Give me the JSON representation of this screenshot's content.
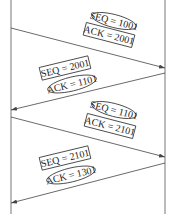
{
  "diagram": {
    "type": "sequence",
    "participants": [
      "left-host",
      "right-host"
    ],
    "colors": {
      "line": "#555555",
      "text": "#222222",
      "background": "#ffffff"
    },
    "messages": [
      {
        "direction": "left-to-right",
        "seq_label": "SEQ = 1001",
        "seq_shape": "ellipse",
        "ack_label": "ACK = 2001",
        "ack_shape": "box"
      },
      {
        "direction": "right-to-left",
        "seq_label": "SEQ = 2001",
        "seq_shape": "box",
        "ack_label": "ACK = 1101",
        "ack_shape": "ellipse"
      },
      {
        "direction": "left-to-right",
        "seq_label": "SEQ = 1101",
        "seq_shape": "ellipse",
        "ack_label": "ACK = 2101",
        "ack_shape": "box"
      },
      {
        "direction": "right-to-left",
        "seq_label": "SEQ = 2101",
        "seq_shape": "box",
        "ack_label": "ACK = 1301",
        "ack_shape": "ellipse"
      }
    ]
  }
}
